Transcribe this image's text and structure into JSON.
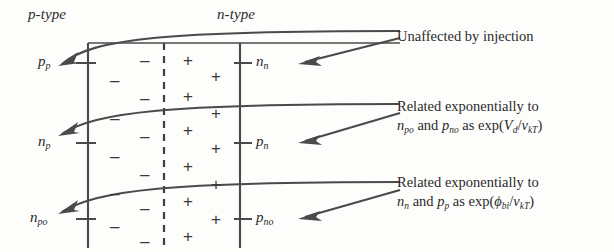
{
  "figure": {
    "regions": {
      "p_type": "p-type",
      "n_type": "n-type"
    },
    "left_axis_labels": [
      {
        "base": "p",
        "sub": "p"
      },
      {
        "base": "n",
        "sub": "p"
      },
      {
        "base": "n",
        "sub": "po"
      }
    ],
    "right_axis_labels": [
      {
        "base": "n",
        "sub": "n"
      },
      {
        "base": "p",
        "sub": "n"
      },
      {
        "base": "p",
        "sub": "no"
      }
    ],
    "charge_signs": {
      "negative": "–",
      "positive": "+",
      "negative_count": 12,
      "positive_count": 12
    },
    "annotations": [
      {
        "id": "unaffected",
        "lines": [
          "Unaffected by injection"
        ]
      },
      {
        "id": "related-vd",
        "lines": [
          "Related exponentially to",
          "n_po and p_no as exp(V_d/v_kT)"
        ]
      },
      {
        "id": "related-phibi",
        "lines": [
          "Related exponentially to",
          "n_n and p_p as exp(ϕ_bi/v_kT)"
        ]
      }
    ],
    "colors": {
      "ink": "#2b2b2b",
      "line": "#4a4a4a",
      "background": "#fdfdfc"
    }
  }
}
